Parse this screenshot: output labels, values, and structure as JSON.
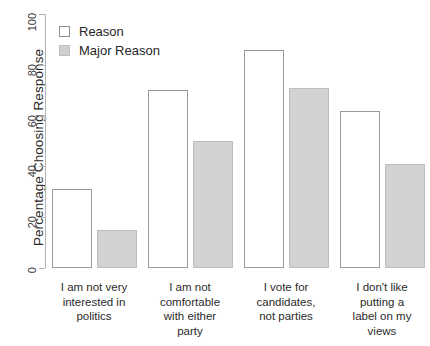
{
  "chart_data": {
    "type": "bar",
    "title": "",
    "subtitle": "",
    "xlabel": "",
    "ylabel": "Percentage Choosing Response",
    "ylim": [
      0,
      100
    ],
    "yticks": [
      0,
      20,
      40,
      60,
      80,
      100
    ],
    "grid": false,
    "legend_position": "top-left",
    "categories": [
      "I am not very interested in politics",
      "I am not comfortable with either party",
      "I vote for candidates, not parties",
      "I don't like putting a label on my views"
    ],
    "category_lines": [
      [
        "I am not very",
        "interested in",
        "politics"
      ],
      [
        "I am not",
        "comfortable",
        "with either",
        "party"
      ],
      [
        "I vote for",
        "candidates,",
        "not parties"
      ],
      [
        "I don't like",
        "putting a",
        "label on my",
        "views"
      ]
    ],
    "series": [
      {
        "name": "Reason",
        "color": "#ffffff",
        "values": [
          31,
          70,
          86,
          62
        ]
      },
      {
        "name": "Major Reason",
        "color": "#d2d2d2",
        "values": [
          15,
          50,
          71,
          41
        ]
      }
    ]
  },
  "legend": {
    "items": [
      {
        "label": "Reason",
        "swatch": "white-square"
      },
      {
        "label": "Major Reason",
        "swatch": "gray-square"
      }
    ]
  },
  "axes": {
    "y_title": "Percentage Choosing Response",
    "y_tick_labels": [
      "0",
      "20",
      "40",
      "60",
      "80",
      "100"
    ]
  },
  "colors": {
    "reason_fill": "#ffffff",
    "major_fill": "#d2d2d2",
    "axis": "#b4b4b4",
    "text": "#231f20"
  }
}
